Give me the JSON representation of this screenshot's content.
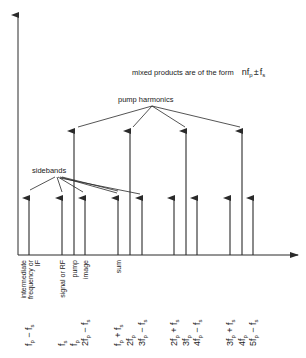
{
  "diagram": {
    "title_note": {
      "prefix": "mixed products are of the form",
      "formula_n": "nf",
      "formula_sub_p": "p",
      "formula_pm": "±",
      "formula_f": "f",
      "formula_sub_s": "s"
    },
    "group_labels": {
      "pump_harmonics": "pump harmonics",
      "sidebands": "sidebands"
    },
    "axes": {
      "y_axis": "vertical amplitude axis",
      "x_axis": "horizontal frequency axis"
    },
    "pump_lines": [
      {
        "x": 74,
        "name": "fp"
      },
      {
        "x": 130,
        "name": "2fp"
      },
      {
        "x": 186,
        "name": "3fp"
      },
      {
        "x": 242,
        "name": "4fp"
      }
    ],
    "sideband_lines": [
      {
        "x": 29,
        "name": "fp-fs"
      },
      {
        "x": 62,
        "name": "fs"
      },
      {
        "x": 85,
        "name": "2fp-fs"
      },
      {
        "x": 118,
        "name": "fp+fs"
      },
      {
        "x": 142,
        "name": "3fp-fs"
      },
      {
        "x": 174,
        "name": "2fp+fs"
      },
      {
        "x": 197,
        "name": "4fp-fs"
      },
      {
        "x": 230,
        "name": "3fp+fs"
      },
      {
        "x": 253,
        "name": "5fp-fs"
      }
    ],
    "descriptive_labels": [
      {
        "x": 30,
        "lines": [
          "intermediate",
          "frequency or",
          "IF"
        ]
      },
      {
        "x": 62,
        "lines": [
          "signal or RF"
        ]
      },
      {
        "x": 74,
        "lines": [
          "pump"
        ]
      },
      {
        "x": 85,
        "lines": [
          "image"
        ]
      },
      {
        "x": 118,
        "lines": [
          "sum"
        ]
      }
    ],
    "formula_labels": [
      {
        "x": 29,
        "coef": "",
        "main": "f",
        "sub": "p",
        "tail": " − f",
        "tail_sub": "s"
      },
      {
        "x": 62,
        "coef": "",
        "main": "f",
        "sub": "s",
        "tail": "",
        "tail_sub": ""
      },
      {
        "x": 74,
        "coef": "",
        "main": "f",
        "sub": "p",
        "tail": "",
        "tail_sub": ""
      },
      {
        "x": 85,
        "coef": "2",
        "main": "f",
        "sub": "p",
        "tail": " − f",
        "tail_sub": "s"
      },
      {
        "x": 118,
        "coef": "",
        "main": "f",
        "sub": "p",
        "tail": " + f",
        "tail_sub": "s"
      },
      {
        "x": 130,
        "coef": "2",
        "main": "f",
        "sub": "p",
        "tail": "",
        "tail_sub": ""
      },
      {
        "x": 142,
        "coef": "3",
        "main": "f",
        "sub": "p",
        "tail": " − f",
        "tail_sub": "s"
      },
      {
        "x": 174,
        "coef": "2",
        "main": "f",
        "sub": "p",
        "tail": " + f",
        "tail_sub": "s"
      },
      {
        "x": 186,
        "coef": "3",
        "main": "f",
        "sub": "p",
        "tail": "",
        "tail_sub": ""
      },
      {
        "x": 197,
        "coef": "4",
        "main": "f",
        "sub": "p",
        "tail": " − f",
        "tail_sub": "s"
      },
      {
        "x": 230,
        "coef": "3",
        "main": "f",
        "sub": "p",
        "tail": " + f",
        "tail_sub": "s"
      },
      {
        "x": 242,
        "coef": "4",
        "main": "f",
        "sub": "p",
        "tail": "",
        "tail_sub": ""
      },
      {
        "x": 253,
        "coef": "5",
        "main": "f",
        "sub": "p",
        "tail": " − f",
        "tail_sub": "s"
      }
    ],
    "colors": {
      "line": "#2a2a2a",
      "text": "#222222",
      "background": "#ffffff"
    }
  }
}
